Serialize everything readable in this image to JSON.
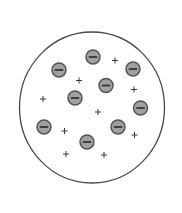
{
  "diagram": {
    "canvas": {
      "width": 182,
      "height": 213,
      "background": "#ffffff"
    },
    "atom": {
      "shape": "circle",
      "cx": 92,
      "cy": 107.5,
      "rx": 72.5,
      "ry": 75.5,
      "stroke": "#4a4a4a",
      "stroke_width": 1.3,
      "fill": "#ffffff"
    },
    "electron_style": {
      "icon": "minus-circle-icon",
      "r": 7,
      "fill": "#a0a0a0",
      "stroke": "#555555",
      "stroke_width": 1.5,
      "minus_color": "#3f3f3f",
      "minus_half_width": 3.5,
      "minus_thickness": 1.8
    },
    "electrons": [
      {
        "cx": 93,
        "cy": 57
      },
      {
        "cx": 59,
        "cy": 70
      },
      {
        "cx": 133,
        "cy": 69
      },
      {
        "cx": 106,
        "cy": 85.5
      },
      {
        "cx": 75,
        "cy": 98
      },
      {
        "cx": 140.5,
        "cy": 108
      },
      {
        "cx": 44,
        "cy": 127
      },
      {
        "cx": 118,
        "cy": 127
      },
      {
        "cx": 87,
        "cy": 142
      }
    ],
    "positive_charge_style": {
      "icon": "plus-icon",
      "half_size": 3,
      "color": "#3a3a3a",
      "stroke_width": 1
    },
    "positive_charges": [
      {
        "cx": 115,
        "cy": 60.5
      },
      {
        "cx": 79,
        "cy": 80.5
      },
      {
        "cx": 134,
        "cy": 89.5
      },
      {
        "cx": 43,
        "cy": 99
      },
      {
        "cx": 98,
        "cy": 112
      },
      {
        "cx": 64.5,
        "cy": 131
      },
      {
        "cx": 134.5,
        "cy": 135
      },
      {
        "cx": 66,
        "cy": 154
      },
      {
        "cx": 104,
        "cy": 155
      }
    ],
    "counts": {
      "electrons": 9,
      "positive_charges": 9
    }
  }
}
